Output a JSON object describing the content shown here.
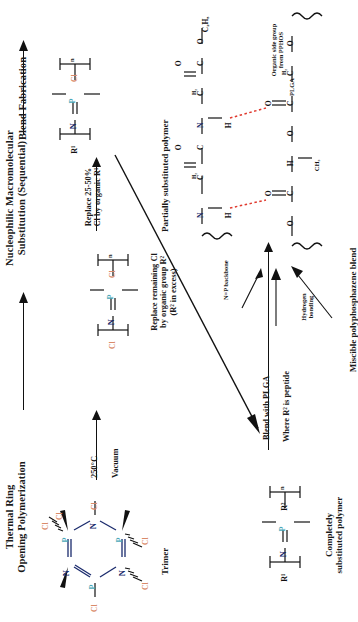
{
  "figure": {
    "orientation": "rotated-90-ccw"
  },
  "stages": {
    "thermal": "Thermal Ring\nOpening Polymerization",
    "nucleophilic": "Nucleophilic Macromolecular\nSubstitution (Sequential)",
    "blend": "Blend Fabrication"
  },
  "conditions": {
    "temperature": "250°C",
    "vacuum": "Vacuum",
    "replace_partial": "Replace 25-50%\nCl by organic R¹",
    "replace_remaining": "Replace remaining Cl\nby organic group R²\n(R² in excess)",
    "blend_plga": "Blend with PLGA",
    "r2_peptide": "Where R² is peptide"
  },
  "structures": {
    "trimer": {
      "caption": "Trimer",
      "atoms": [
        "P",
        "N",
        "P",
        "N",
        "P",
        "N"
      ],
      "substituent": "Cl",
      "substituent_count": 6,
      "formula": "N₃P₃Cl₆"
    },
    "dichloro_polymer": {
      "caption": "",
      "backbone": [
        "N",
        "P"
      ],
      "left_sub": "Cl",
      "right_sub": "Cl",
      "repeat": "n"
    },
    "partial_polymer": {
      "caption": "Partially substituted polymer",
      "backbone": [
        "N",
        "P"
      ],
      "left_sub": "R¹",
      "right_sub": "Cl",
      "repeat": "n"
    },
    "complete_polymer": {
      "caption": "Completely\nsubstituted polymer",
      "backbone": [
        "N",
        "P"
      ],
      "left_sub": "R¹",
      "right_sub": "R²",
      "repeat": "n"
    },
    "blend": {
      "caption": "Miscible polyphosphazene blend",
      "label_backbone": "N=P backbone",
      "label_sidegroup": "Organic side group\nfrom PPHOS",
      "label_plga": "PLGA",
      "label_hbond": "Hydrogen\nbonding",
      "hbond_color": "#e03a2f",
      "pphos_atoms": {
        "n1": "N",
        "h1": "H",
        "c1": "C",
        "ch2a": "H₂",
        "o1": "O",
        "n2": "N",
        "h2": "H",
        "c2": "C",
        "ch2b": "H₂",
        "o2": "O",
        "ester": "O",
        "ethyl": "C₂H₅"
      },
      "plga_atoms": {
        "o_a": "O",
        "c_a": "C",
        "o_db_a": "O",
        "ch": "H",
        "ch3": "CH₃",
        "o_b": "O",
        "c_b": "C",
        "o_db_b": "O",
        "ch2": "H₂"
      }
    }
  },
  "colors": {
    "phosphorus": "#4aa8b8",
    "nitrogen": "#1a2a6c",
    "chlorine": "#d98b6a",
    "bond": "#111111",
    "hydrogen_bond": "#e03a2f",
    "background": "#ffffff"
  }
}
